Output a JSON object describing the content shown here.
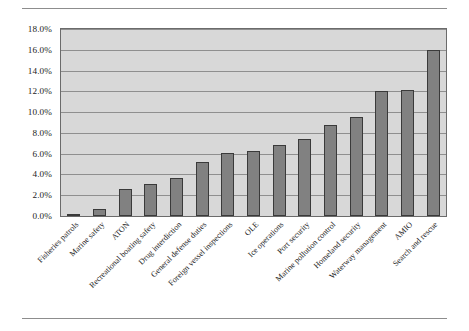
{
  "chart_data": {
    "type": "bar",
    "title": "",
    "subtitle": "",
    "xlabel": "",
    "ylabel": "",
    "ylim": [
      0,
      0.18
    ],
    "grid": true,
    "legend": "none",
    "orientation": "vertical",
    "bar_color": "#818181",
    "bar_edge_color": "#3a3a3a",
    "plot_background": "#d8d8d8",
    "gridline_color": "#8f8f8f",
    "y_tick_labels": [
      "18.0%",
      "16.0%",
      "14.0%",
      "12.0%",
      "10.0%",
      "8.0%",
      "6.0%",
      "4.0%",
      "2.0%",
      "0.0%"
    ],
    "y_tick_values": [
      0.18,
      0.16,
      0.14,
      0.12,
      0.1,
      0.08,
      0.06,
      0.04,
      0.02,
      0.0
    ],
    "categories": [
      "Fisheries patrols",
      "Marine safety",
      "ATON",
      "Recreational boating safety",
      "Drug interdiction",
      "General defense duties",
      "Foreign vessel inspections",
      "OLE",
      "Ice operations",
      "Port security",
      "Marine pollution control",
      "Homeland security",
      "Waterway management",
      "AMIO",
      "Search and rescue"
    ],
    "values": [
      0.002,
      0.007,
      0.026,
      0.031,
      0.037,
      0.052,
      0.061,
      0.063,
      0.068,
      0.074,
      0.088,
      0.095,
      0.12,
      0.121,
      0.16
    ],
    "value_labels": [
      "0.2%",
      "0.7%",
      "2.6%",
      "3.1%",
      "3.7%",
      "5.2%",
      "6.1%",
      "6.3%",
      "6.8%",
      "7.4%",
      "8.8%",
      "9.5%",
      "12.0%",
      "12.1%",
      "16.0%"
    ]
  }
}
